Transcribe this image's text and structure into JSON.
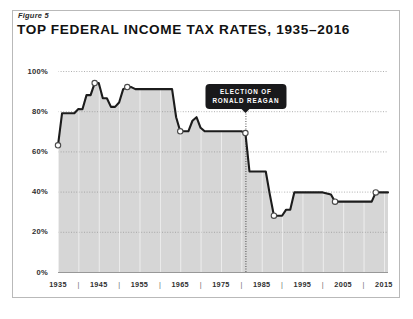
{
  "figure": {
    "label": "Figure 5",
    "title": "TOP FEDERAL INCOME TAX RATES, 1935–2016"
  },
  "annotation": {
    "line1": "ELECTION OF",
    "line2": "RONALD REAGAN",
    "at_year": 1981
  },
  "colors": {
    "line": "#1c1c1c",
    "area_fill": "#d6d6d6",
    "marker_fill": "#ffffff",
    "marker_stroke": "#4a4a4a",
    "grid": "#9a9a9a",
    "frame": "#b9b9b9",
    "annotation_bg": "#19191b",
    "text": "#2f2f2f"
  },
  "chart_data": {
    "type": "line",
    "title": "TOP FEDERAL INCOME TAX RATES, 1935–2016",
    "xlabel": "",
    "ylabel": "",
    "xlim": [
      1935,
      2016
    ],
    "ylim": [
      0,
      100
    ],
    "grid": true,
    "legend": "none",
    "ytick_labels": [
      "0%",
      "20%",
      "40%",
      "60%",
      "80%",
      "100%"
    ],
    "ytick_values": [
      0,
      20,
      40,
      60,
      80,
      100
    ],
    "xtick_labels": [
      "1935",
      "1945",
      "1955",
      "1965",
      "1975",
      "1985",
      "1995",
      "2005",
      "2015"
    ],
    "xtick_values": [
      1935,
      1945,
      1955,
      1965,
      1975,
      1985,
      1995,
      2005,
      2015
    ],
    "xtick_minor": [
      1940,
      1950,
      1960,
      1970,
      1980,
      1990,
      2000,
      2010
    ],
    "markers": [
      {
        "x": 1935,
        "y": 63
      },
      {
        "x": 1944,
        "y": 94
      },
      {
        "x": 1952,
        "y": 92
      },
      {
        "x": 1965,
        "y": 70
      },
      {
        "x": 1981,
        "y": 69.1
      },
      {
        "x": 1988,
        "y": 28
      },
      {
        "x": 2003,
        "y": 35
      },
      {
        "x": 2013,
        "y": 39.6
      }
    ],
    "annotations": [
      {
        "text": "ELECTION OF RONALD REAGAN",
        "x": 1981,
        "type": "callout-with-vertical-dotted-line"
      }
    ],
    "x": [
      1935,
      1936,
      1937,
      1938,
      1939,
      1940,
      1941,
      1942,
      1943,
      1944,
      1945,
      1946,
      1947,
      1948,
      1949,
      1950,
      1951,
      1952,
      1953,
      1954,
      1955,
      1956,
      1957,
      1958,
      1959,
      1960,
      1961,
      1962,
      1963,
      1964,
      1965,
      1966,
      1967,
      1968,
      1969,
      1970,
      1971,
      1972,
      1973,
      1974,
      1975,
      1976,
      1977,
      1978,
      1979,
      1980,
      1981,
      1982,
      1983,
      1984,
      1985,
      1986,
      1987,
      1988,
      1989,
      1990,
      1991,
      1992,
      1993,
      1994,
      1995,
      1996,
      1997,
      1998,
      1999,
      2000,
      2001,
      2002,
      2003,
      2004,
      2005,
      2006,
      2007,
      2008,
      2009,
      2010,
      2011,
      2012,
      2013,
      2014,
      2015,
      2016
    ],
    "y": [
      63,
      79,
      79,
      79,
      79,
      81.1,
      81,
      88,
      88,
      94,
      94,
      86.45,
      86.45,
      82.13,
      82.13,
      84.36,
      91,
      92,
      92,
      91,
      91,
      91,
      91,
      91,
      91,
      91,
      91,
      91,
      91,
      77,
      70,
      70,
      70,
      75.25,
      77,
      71.75,
      70,
      70,
      70,
      70,
      70,
      70,
      70,
      70,
      70,
      70,
      69.125,
      50,
      50,
      50,
      50,
      50,
      38.5,
      28,
      28,
      28,
      31,
      31,
      39.6,
      39.6,
      39.6,
      39.6,
      39.6,
      39.6,
      39.6,
      39.6,
      39.1,
      38.6,
      35,
      35,
      35,
      35,
      35,
      35,
      35,
      35,
      35,
      35,
      39.6,
      39.6,
      39.6,
      39.6
    ],
    "series": [
      {
        "name": "Top federal income tax rate",
        "values": [
          63,
          79,
          79,
          79,
          79,
          81.1,
          81,
          88,
          88,
          94,
          94,
          86.45,
          86.45,
          82.13,
          82.13,
          84.36,
          91,
          92,
          92,
          91,
          91,
          91,
          91,
          91,
          91,
          91,
          91,
          91,
          91,
          77,
          70,
          70,
          70,
          75.25,
          77,
          71.75,
          70,
          70,
          70,
          70,
          70,
          70,
          70,
          70,
          70,
          70,
          69.125,
          50,
          50,
          50,
          50,
          50,
          38.5,
          28,
          28,
          28,
          31,
          31,
          39.6,
          39.6,
          39.6,
          39.6,
          39.6,
          39.6,
          39.6,
          39.6,
          39.1,
          38.6,
          35,
          35,
          35,
          35,
          35,
          35,
          35,
          35,
          35,
          35,
          39.6,
          39.6,
          39.6,
          39.6
        ]
      }
    ]
  }
}
